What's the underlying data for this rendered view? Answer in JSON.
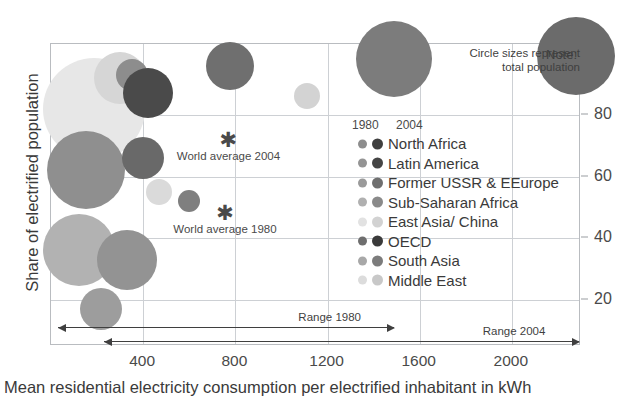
{
  "chart_data": {
    "type": "scatter",
    "title": "",
    "xlabel": "Mean residential electricity consumption per electrified inhabitant in kWh",
    "ylabel": "Share of electrified population",
    "xlim": [
      0,
      2300
    ],
    "ylim": [
      5,
      103
    ],
    "xticks": [
      400,
      800,
      1200,
      1600,
      2000
    ],
    "yticks": [
      20,
      40,
      60,
      80
    ],
    "grid": true,
    "legend_position": "inside-right",
    "note": {
      "title": "Note:",
      "line1": "Circle sizes represent",
      "line2": "total population"
    },
    "legend": {
      "header_left": "1980",
      "header_right": "2004",
      "entries": [
        {
          "label": "North Africa",
          "color_1980": "#8d8d8d",
          "color_2004": "#3f3f3f"
        },
        {
          "label": "Latin America",
          "color_1980": "#949494",
          "color_2004": "#454545"
        },
        {
          "label": "Former USSR & EEurope",
          "color_1980": "#9a9a9a",
          "color_2004": "#6f6f6f"
        },
        {
          "label": "Sub-Saharan Africa",
          "color_1980": "#b0b0b0",
          "color_2004": "#8a8a8a"
        },
        {
          "label": "East Asia/ China",
          "color_1980": "#e2e2e2",
          "color_2004": "#d2d2d2"
        },
        {
          "label": "OECD",
          "color_1980": "#6e6e6e",
          "color_2004": "#3a3a3a"
        },
        {
          "label": "South Asia",
          "color_1980": "#a8a8a8",
          "color_2004": "#7c7c7c"
        },
        {
          "label": "Middle East",
          "color_1980": "#dcdcdc",
          "color_2004": "#c8c8c8"
        }
      ]
    },
    "annotations": [
      {
        "name": "world-average-2004",
        "label": "World average 2004",
        "x": 770,
        "y": 72
      },
      {
        "name": "world-average-1980",
        "label": "World average 1980",
        "x": 755,
        "y": 48
      }
    ],
    "ranges": [
      {
        "name": "range-1980",
        "label": "Range 1980",
        "start": 30,
        "end": 1490,
        "double_ended": true
      },
      {
        "name": "range-2004",
        "label": "Range 2004",
        "start": 230,
        "end": 2290,
        "double_ended": true
      }
    ],
    "points": [
      {
        "series": "East Asia/ China",
        "year": 1980,
        "x": 185,
        "y": 82,
        "r": 51,
        "color": "#e7e7e7"
      },
      {
        "series": "East Asia/ China",
        "year": 2004,
        "x": 300,
        "y": 92,
        "r": 26,
        "color": "#d6d6d6"
      },
      {
        "series": "North Africa",
        "year": 1980,
        "x": 350,
        "y": 93,
        "r": 16,
        "color": "#8d8d8d"
      },
      {
        "series": "North Africa",
        "year": 2004,
        "x": 420,
        "y": 87,
        "r": 25,
        "color": "#4a4a4a"
      },
      {
        "series": "Latin America",
        "year": 1980,
        "x": 775,
        "y": 96,
        "r": 24,
        "color": "#6f6f6f"
      },
      {
        "series": "Middle East",
        "year": 2004,
        "x": 1110,
        "y": 86,
        "r": 13,
        "color": "#d3d3d3"
      },
      {
        "series": "OECD",
        "year": 1980,
        "x": 1490,
        "y": 98,
        "r": 38,
        "color": "#7c7c7c"
      },
      {
        "series": "OECD",
        "year": 2004,
        "x": 2280,
        "y": 99,
        "r": 39,
        "color": "#6b6b6b"
      },
      {
        "series": "Former USSR & EEurope",
        "year": 1980,
        "x": 150,
        "y": 62,
        "r": 39,
        "color": "#8f8f8f"
      },
      {
        "series": "Former USSR & EEurope",
        "year": 2004,
        "x": 400,
        "y": 66,
        "r": 21,
        "color": "#696969"
      },
      {
        "series": "Middle East",
        "year": 1980,
        "x": 470,
        "y": 55,
        "r": 13,
        "color": "#dadada"
      },
      {
        "series": "South Asia",
        "year": 2004,
        "x": 600,
        "y": 52,
        "r": 11,
        "color": "#7f7f7f"
      },
      {
        "series": "Sub-Saharan Africa",
        "year": 1980,
        "x": 120,
        "y": 36,
        "r": 36,
        "color": "#b2b2b2"
      },
      {
        "series": "South Asia",
        "year": 1980,
        "x": 330,
        "y": 33,
        "r": 30,
        "color": "#939393"
      },
      {
        "series": "Sub-Saharan Africa",
        "year": 2004,
        "x": 215,
        "y": 17,
        "r": 21,
        "color": "#9d9d9d"
      }
    ]
  }
}
